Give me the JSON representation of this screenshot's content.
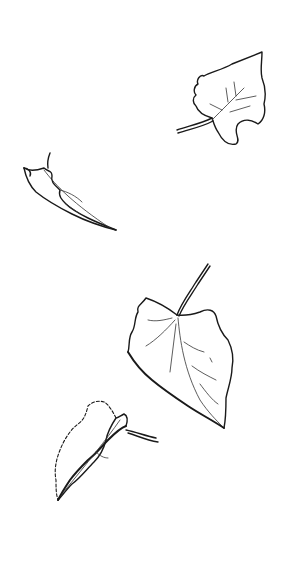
{
  "scene": {
    "background": "#ffffff",
    "ink_color": "#1a1a1a",
    "style": "hand-drawn line sketch",
    "leaves": [
      {
        "id": "leaf-top-right",
        "description": "lobed leaf with long stem pointing left",
        "bbox": [
          175,
          52,
          268,
          146
        ]
      },
      {
        "id": "leaf-curled-left",
        "description": "curled narrow leaf with short stem",
        "bbox": [
          20,
          150,
          118,
          232
        ]
      },
      {
        "id": "leaf-heart-center",
        "description": "large heart-shaped leaf with stem at top",
        "bbox": [
          125,
          262,
          236,
          428
        ]
      },
      {
        "id": "leaf-folded-bottom",
        "description": "folded leaf with dashed edge and curving stem",
        "bbox": [
          52,
          398,
          160,
          505
        ]
      }
    ]
  }
}
